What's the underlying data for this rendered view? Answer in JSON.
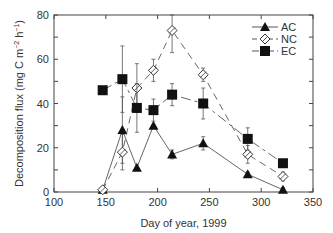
{
  "chart_data": {
    "type": "line",
    "title": "",
    "xlabel": "Day of year, 1999",
    "ylabel": "Decomposition flux (mg C m⁻² h⁻¹)",
    "ylabel_parts": {
      "prefix": "Decomposition flux (mg C m",
      "exp1": "−2",
      "mid": " h",
      "exp2": "−1",
      "suffix": ")"
    },
    "xlim": [
      100,
      350
    ],
    "ylim": [
      0,
      80
    ],
    "xticks": [
      100,
      150,
      200,
      250,
      300,
      350
    ],
    "yticks": [
      0,
      20,
      40,
      60,
      80
    ],
    "grid": false,
    "legend_position": "upper right",
    "series": [
      {
        "name": "AC",
        "marker": "filled-triangle",
        "line": "solid",
        "x": [
          147,
          166,
          180,
          196,
          214,
          244,
          287,
          321
        ],
        "values": [
          1,
          28,
          11,
          30,
          17,
          22,
          8,
          1
        ],
        "error": [
          1,
          15,
          0,
          0,
          2,
          3,
          1,
          1
        ]
      },
      {
        "name": "NC",
        "marker": "open-diamond",
        "line": "dashed",
        "x": [
          147,
          166,
          180,
          196,
          214,
          244,
          287,
          321
        ],
        "values": [
          1,
          18,
          47,
          55,
          73,
          53,
          17,
          7
        ],
        "error": [
          1,
          8,
          11,
          5,
          10,
          3,
          4,
          2
        ]
      },
      {
        "name": "EC",
        "marker": "filled-square",
        "line": "dash-dot",
        "x": [
          147,
          166,
          180,
          196,
          214,
          244,
          287,
          321
        ],
        "values": [
          46,
          51,
          38,
          37,
          44,
          40,
          24,
          13
        ],
        "error": [
          1.5,
          15,
          11,
          5,
          5,
          7,
          5,
          1
        ]
      }
    ]
  }
}
